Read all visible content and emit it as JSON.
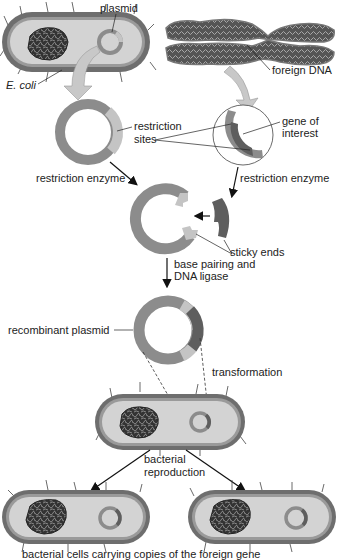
{
  "colors": {
    "cell_wall": "#6e6e6e",
    "cytoplasm": "#d3d3d3",
    "plasmid": "#8c8c8c",
    "restriction_site": "#c4c4c4",
    "gene": "#5e5e5e",
    "arrow_fill": "#c8c8c8",
    "text": "#222222"
  },
  "labels": {
    "plasmid": "plasmid",
    "ecoli": "E. coli",
    "foreign_dna": "foreign DNA",
    "restriction_sites_line1": "restriction",
    "restriction_sites_line2": "sites",
    "gene_of_interest_line1": "gene of",
    "gene_of_interest_line2": "interest",
    "restriction_enzyme_left": "restriction enzyme",
    "restriction_enzyme_right": "restriction enzyme",
    "sticky_ends": "sticky ends",
    "base_pairing_line1": "base pairing and",
    "base_pairing_line2": "DNA ligase",
    "recombinant_plasmid": "recombinant plasmid",
    "transformation": "transformation",
    "bacterial_reproduction_line1": "bacterial",
    "bacterial_reproduction_line2": "reproduction",
    "caption": "bacterial cells carrying copies of the foreign gene"
  }
}
